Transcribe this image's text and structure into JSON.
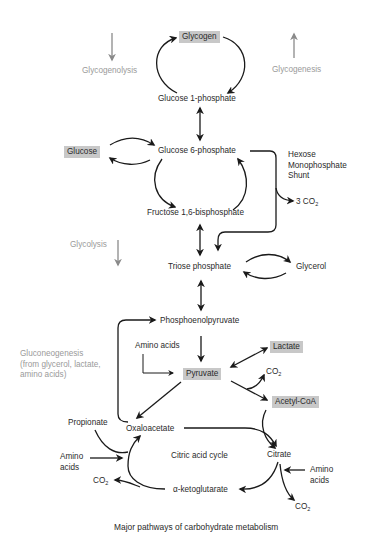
{
  "diagram": {
    "title": "Major pathways of carbohydrate metabolism",
    "side_labels": {
      "glycogenolysis": "Glycogenolysis",
      "glycogenesis": "Glycogenesis",
      "glycolysis": "Glycolysis",
      "gluconeogenesis": "Gluconeogenesis\n(from glycerol, lactate,\namino acids)",
      "hmp_shunt": "Hexose\nMonophosphate\nShunt"
    },
    "nodes": {
      "glycogen": "Glycogen",
      "glucose_1p": "Glucose 1-phosphate",
      "glucose": "Glucose",
      "glucose_6p": "Glucose 6-phosphate",
      "fructose_16bp": "Fructose 1,6-bisphosphate",
      "co2_3": "3 CO",
      "triose_p": "Triose phosphate",
      "glycerol": "Glycerol",
      "pep": "Phosphoenolpyruvate",
      "amino_acids_1": "Amino acids",
      "pyruvate": "Pyruvate",
      "lactate": "Lactate",
      "co2_a": "CO",
      "acetyl_coa": "Acetyl-CoA",
      "propionate": "Propionate",
      "oxaloacetate": "Oxaloacetate",
      "amino_acids_2": "Amino\nacids",
      "co2_b": "CO",
      "citric_cycle": "Citric acid cycle",
      "citrate": "Citrate",
      "amino_acids_3": "Amino\nacids",
      "akg": "α-ketoglutarate",
      "co2_c": "CO"
    },
    "subscript_two": "2",
    "colors": {
      "text": "#2a2a2a",
      "gray_text": "#9a9a9a",
      "highlight_box": "#c8c8c8",
      "arrow": "#1a1a1a",
      "gray_arrow": "#8a8a8a"
    }
  }
}
